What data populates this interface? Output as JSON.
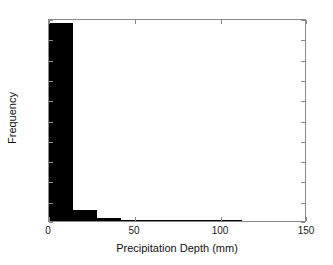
{
  "chart_data": {
    "type": "bar",
    "title": "",
    "subtitle": "",
    "xlabel": "Precipitation Depth (mm)",
    "ylabel": "Frequency",
    "xlim": [
      0,
      150
    ],
    "ylim": [
      0,
      10000
    ],
    "xticks": [
      0,
      50,
      100,
      150
    ],
    "xtick_labels": [
      "0",
      "50",
      "100",
      "150"
    ],
    "yticks": [
      0,
      1000,
      2000,
      3000,
      4000,
      5000,
      6000,
      7000,
      8000,
      9000,
      10000
    ],
    "ytick_labels": [
      "0",
      "1000",
      "2000",
      "3000",
      "4000",
      "5000",
      "6000",
      "7000",
      "8000",
      "9000",
      "10000"
    ],
    "grid": false,
    "legend": null,
    "legend_position": "none",
    "bar_color": "#000000",
    "bin_width": 14,
    "bin_edges": [
      0,
      14,
      28,
      42,
      56,
      70,
      84,
      98,
      112,
      126,
      140
    ],
    "categories": [
      "0-14",
      "14-28",
      "28-42",
      "42-56",
      "56-70",
      "70-84",
      "84-98",
      "98-112",
      "112-126",
      "126-140"
    ],
    "values": [
      9750,
      560,
      150,
      45,
      15,
      5,
      2,
      1,
      0,
      0
    ],
    "annotations": []
  },
  "figure": {
    "axis_color": "#8a8a8a",
    "background": "#ffffff",
    "text_color": "#111111"
  }
}
